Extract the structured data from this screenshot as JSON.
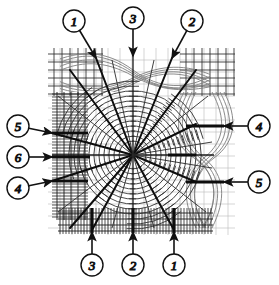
{
  "figure": {
    "kind": "technical-line-diagram",
    "canvas": {
      "width": 279,
      "height": 285
    },
    "plate": {
      "x": 48,
      "y": 48,
      "width": 187,
      "height": 187
    },
    "center": {
      "x": 133,
      "y": 155
    },
    "ink_color": "#111111",
    "light_ink_color": "#8a8a8a",
    "background_color": "#ffffff"
  },
  "callouts": {
    "top": [
      {
        "label": "1",
        "cx": 74,
        "cy": 21,
        "tip_x": 96,
        "tip_y": 58
      },
      {
        "label": "3",
        "cx": 133,
        "cy": 18,
        "tip_x": 133,
        "tip_y": 56
      },
      {
        "label": "2",
        "cx": 192,
        "cy": 21,
        "tip_x": 172,
        "tip_y": 58
      }
    ],
    "bottom": [
      {
        "label": "3",
        "cx": 92,
        "cy": 265,
        "tip_x": 92,
        "tip_y": 232
      },
      {
        "label": "2",
        "cx": 133,
        "cy": 265,
        "tip_x": 133,
        "tip_y": 232
      },
      {
        "label": "1",
        "cx": 174,
        "cy": 265,
        "tip_x": 174,
        "tip_y": 232
      }
    ],
    "left": [
      {
        "label": "5",
        "cx": 18,
        "cy": 126,
        "tip_x": 52,
        "tip_y": 133
      },
      {
        "label": "6",
        "cx": 18,
        "cy": 157,
        "tip_x": 52,
        "tip_y": 157
      },
      {
        "label": "4",
        "cx": 18,
        "cy": 188,
        "tip_x": 52,
        "tip_y": 181
      }
    ],
    "right": [
      {
        "label": "4",
        "cx": 259,
        "cy": 126,
        "tip_x": 224,
        "tip_y": 126
      },
      {
        "label": "5",
        "cx": 259,
        "cy": 182,
        "tip_x": 224,
        "tip_y": 182
      }
    ],
    "circle_radius": 11
  },
  "legend_numbers": [
    "1",
    "2",
    "3",
    "4",
    "5",
    "6"
  ],
  "regions": {
    "top_left_mesh": "rectangular grid mesh",
    "top_band": "horizontal braided strands",
    "top_right_mesh": "rectangular grid mesh",
    "left_band": "dense horizontal hatching",
    "right_band": "vertical braided strands over grid",
    "bottom_band": "dense vertical hatching",
    "center": "radial spokes with concentric arc fans"
  },
  "spokes": {
    "count": 16,
    "thick_angles_deg": [
      -108,
      -72,
      -36,
      0,
      36,
      72,
      108,
      144,
      180,
      216
    ],
    "length": 118
  }
}
